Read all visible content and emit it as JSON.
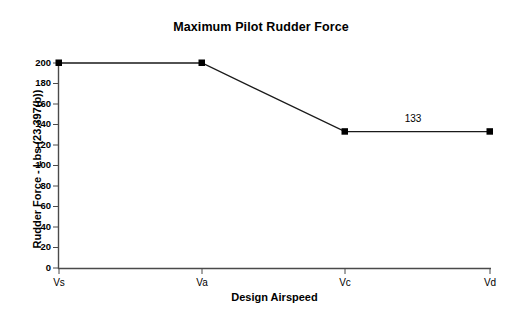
{
  "chart_data": {
    "type": "line",
    "title": "Maximum Pilot Rudder Force",
    "xlabel": "Design Airspeed",
    "ylabel": "Rudder Force - Lbs (23.397(b))",
    "categories": [
      "Vs",
      "Va",
      "Vc",
      "Vd"
    ],
    "values": [
      200,
      200,
      133,
      133
    ],
    "series": [
      {
        "name": "Maximum Pilot Rudder Force",
        "values": [
          200,
          200,
          133,
          133
        ],
        "color": "#000000",
        "marker": "square"
      }
    ],
    "ylim": [
      0,
      200
    ],
    "yticks": [
      200,
      180,
      160,
      140,
      120,
      100,
      80,
      60,
      40,
      20,
      0
    ],
    "ytick_labels": [
      "200",
      "180",
      "160",
      "140",
      "120",
      "100",
      "80",
      "60",
      "40",
      "20",
      "0"
    ],
    "xtick_labels": [
      "Vs",
      "Va",
      "Vc",
      "Vd"
    ],
    "grid": false,
    "legend": false,
    "annotations": [
      {
        "text": "133",
        "x_category": "Vc-Vd",
        "y_value": 133
      }
    ],
    "data_labels": [
      "",
      "",
      "",
      "133"
    ]
  }
}
